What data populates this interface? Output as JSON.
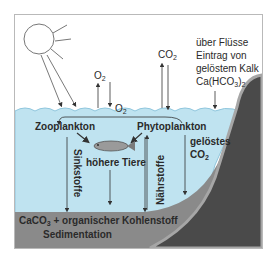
{
  "diagram": {
    "title": "",
    "labels": {
      "o2_top": "O",
      "o2_top_sub": "2",
      "o2_water": "O",
      "o2_water_sub": "2",
      "co2_top": "CO",
      "co2_top_sub": "2",
      "river_line1": "über Flüsse",
      "river_line2": "Eintrag von",
      "river_line3": "gelöstem Kalk",
      "river_line4_a": "Ca(HCO",
      "river_line4_sub": "3",
      "river_line4_b": ")",
      "river_line4_sub2": "2",
      "zooplankton": "Zooplankton",
      "phytoplankton": "Phytoplankton",
      "higher_animals": "höhere Tiere",
      "sinking_matter": "Sinkstoffe",
      "nutrients": "Nährstoffe",
      "dissolved_co2_line1": "gelöstes",
      "dissolved_co2_line2_a": "CO",
      "dissolved_co2_line2_sub": "2",
      "sediment_line1_a": "CaCO",
      "sediment_line1_sub": "3",
      "sediment_line1_b": " + organischer Kohlenstoff",
      "sediment_line2": "Sedimentation"
    },
    "colors": {
      "sky": "#ffffff",
      "water": "#bfe3f0",
      "water_surface": "#8fc6dd",
      "sediment": "#8a8a8a",
      "rock": "#4a4a4a",
      "rock_edge": "#a6a6a6",
      "arrow": "#333333",
      "text": "#2a2a2a"
    }
  }
}
